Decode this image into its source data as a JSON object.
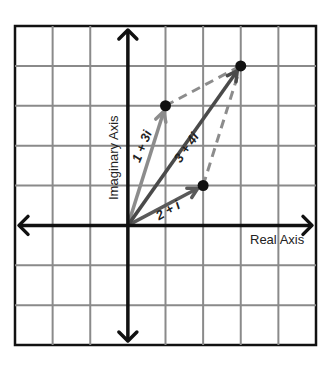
{
  "diagram": {
    "grid": {
      "x_min": -3,
      "x_max": 5,
      "y_min": -3,
      "y_max": 5
    },
    "axes": {
      "real_label": "Real Axis",
      "imaginary_label": "Imaginary Axis"
    },
    "vectors": [
      {
        "id": "v1",
        "label": "1 + 3i",
        "re": 1,
        "im": 3,
        "color": "#8c8c8c"
      },
      {
        "id": "v2",
        "label": "2 + i",
        "re": 2,
        "im": 1,
        "color": "#5a5a5a"
      },
      {
        "id": "sum",
        "label": "3 + 4i",
        "re": 3,
        "im": 4,
        "color": "#4a4a4a"
      }
    ],
    "dashed_color": "#8c8c8c",
    "point_color": "#111111",
    "axis_color": "#111111",
    "grid_color": "#8a8a8a"
  }
}
